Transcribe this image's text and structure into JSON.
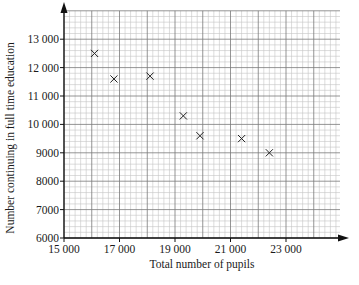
{
  "chart_data": {
    "type": "scatter",
    "title": "",
    "xlabel": "Total number of pupils",
    "ylabel": "Number continuing in full time education",
    "xlim": [
      15000,
      25000
    ],
    "ylim": [
      6000,
      14000
    ],
    "x_ticks": [
      15000,
      17000,
      19000,
      21000,
      23000
    ],
    "x_tick_labels": [
      "15 000",
      "17 000",
      "19 000",
      "21 000",
      "23 000"
    ],
    "y_ticks": [
      6000,
      7000,
      8000,
      9000,
      10000,
      11000,
      12000,
      13000
    ],
    "y_tick_labels": [
      "6000",
      "7000",
      "8000",
      "9000",
      "10 000",
      "11 000",
      "12 000",
      "13 000"
    ],
    "grid": {
      "on": true,
      "major_step_x": 1000,
      "major_step_y": 1000,
      "minor_step_x": 200,
      "minor_step_y": 200
    },
    "marker": "x",
    "legend": null,
    "series": [
      {
        "name": "pupils",
        "points": [
          {
            "x": 16100,
            "y": 12500
          },
          {
            "x": 16800,
            "y": 11600
          },
          {
            "x": 18100,
            "y": 11700
          },
          {
            "x": 19300,
            "y": 10300
          },
          {
            "x": 19900,
            "y": 9600
          },
          {
            "x": 21400,
            "y": 9500
          },
          {
            "x": 22400,
            "y": 9000
          }
        ]
      }
    ]
  },
  "colors": {
    "axis": "#111111",
    "major_grid": "#7a7a7a",
    "minor_grid": "#c4c4c4",
    "marker": "#222222"
  }
}
